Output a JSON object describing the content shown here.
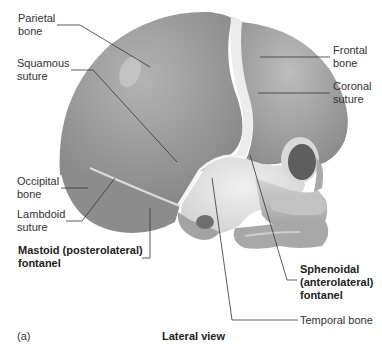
{
  "figure": {
    "panel_letter": "(a)",
    "view_title": "Lateral view"
  },
  "labels": {
    "parietal_bone": "Parietal\nbone",
    "squamous_suture": "Squamous\nsuture",
    "frontal_bone": "Frontal\nbone",
    "coronal_suture": "Coronal\nsuture",
    "occipital_bone": "Occipital\nbone",
    "lambdoid_suture": "Lambdoid\nsuture",
    "mastoid_fontanel": "Mastoid (posterolateral)\nfontanel",
    "sphenoidal_fontanel": "Sphenoidal\n(anterolateral)\nfontanel",
    "temporal_bone": "Temporal bone"
  },
  "colors": {
    "bone_dark": "#8f8f8f",
    "bone_mid": "#a6a6a6",
    "bone_light": "#d9d9d9",
    "fontanel": "#e6e6e6",
    "leader_line": "#333333"
  }
}
